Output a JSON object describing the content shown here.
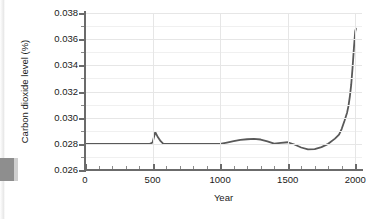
{
  "chart_data": {
    "type": "line",
    "title": "",
    "subtitle": "",
    "xlabel": "Year",
    "ylabel": "Carbon dioxide level (%)",
    "xlim": [
      0,
      2050
    ],
    "ylim": [
      0.026,
      0.038
    ],
    "grid": true,
    "minor_grid": true,
    "legend": "none",
    "xticks": [
      "0",
      "500",
      "1000",
      "1500",
      "2000"
    ],
    "xtick_values": [
      0,
      500,
      1000,
      1500,
      2000
    ],
    "xtick_minor_step": 100,
    "yticks": [
      "0.026",
      "0.028",
      "0.030",
      "0.032",
      "0.034",
      "0.036",
      "0.038"
    ],
    "ytick_values": [
      0.026,
      0.028,
      0.03,
      0.032,
      0.034,
      0.036,
      0.038
    ],
    "ytick_minor_step": 0.001,
    "line_color": "#595959",
    "line_width": 1.8,
    "series": [
      {
        "name": "Carbon dioxide level",
        "x": [
          0,
          100,
          200,
          300,
          400,
          480,
          500,
          520,
          540,
          560,
          580,
          600,
          650,
          700,
          800,
          900,
          1000,
          1050,
          1100,
          1150,
          1200,
          1250,
          1300,
          1350,
          1400,
          1450,
          1500,
          1550,
          1600,
          1650,
          1700,
          1750,
          1800,
          1850,
          1880,
          1900,
          1920,
          1940,
          1950,
          1960,
          1970,
          1980,
          1990,
          2000,
          2005
        ],
        "y": [
          0.028,
          0.028,
          0.028,
          0.028,
          0.028,
          0.028,
          0.0281,
          0.0289,
          0.0285,
          0.0282,
          0.028,
          0.028,
          0.028,
          0.028,
          0.028,
          0.028,
          0.028,
          0.0281,
          0.0282,
          0.0283,
          0.02835,
          0.02838,
          0.02833,
          0.02818,
          0.02802,
          0.02808,
          0.02812,
          0.02795,
          0.02772,
          0.02757,
          0.0276,
          0.02775,
          0.028,
          0.0284,
          0.0287,
          0.02915,
          0.02975,
          0.0304,
          0.0309,
          0.0316,
          0.0325,
          0.0338,
          0.0353,
          0.0366,
          0.0368
        ]
      }
    ]
  }
}
